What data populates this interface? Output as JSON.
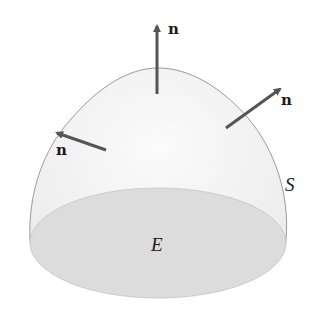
{
  "diagram": {
    "surface_label": "S",
    "region_label": "E",
    "normals": [
      {
        "id": "top",
        "label": "n"
      },
      {
        "id": "right",
        "label": "n"
      },
      {
        "id": "left",
        "label": "n"
      }
    ],
    "colors": {
      "surface_fill": "#f4f4f4",
      "base_fill": "#dcdcdc",
      "outline": "#9a9a9a",
      "arrow": "#555555",
      "text": "#1a1a1a"
    }
  }
}
